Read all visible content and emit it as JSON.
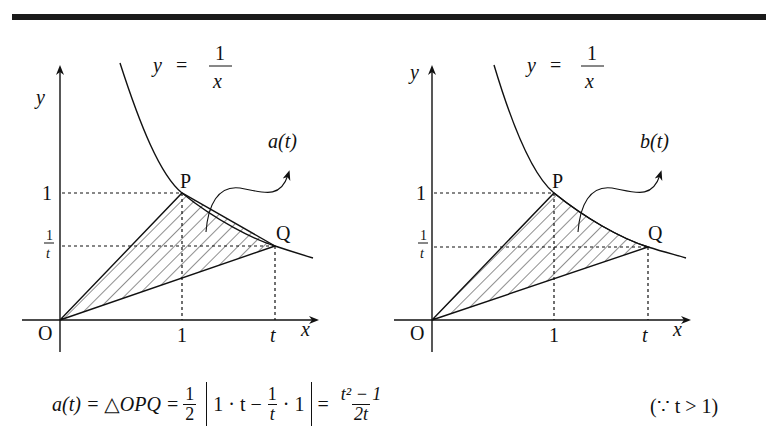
{
  "figures": [
    {
      "id": "left",
      "curve_label": {
        "lhs": "y",
        "eq": "=",
        "num": "1",
        "den": "x"
      },
      "axis_labels": {
        "y": "y",
        "x": "x",
        "origin": "O"
      },
      "tick_labels": {
        "x1": "1",
        "xt": "t",
        "y1": "1",
        "yt_num": "1",
        "yt_den": "t"
      },
      "points": {
        "P": "P",
        "Q": "Q"
      },
      "region_label": "a(t)",
      "region_desc": "Triangle OPQ (hatched)"
    },
    {
      "id": "right",
      "curve_label": {
        "lhs": "y",
        "eq": "=",
        "num": "1",
        "den": "x"
      },
      "axis_labels": {
        "y": "y",
        "x": "x",
        "origin": "O"
      },
      "tick_labels": {
        "x1": "1",
        "xt": "t",
        "y1": "1",
        "yt_num": "1",
        "yt_den": "t"
      },
      "points": {
        "P": "P",
        "Q": "Q"
      },
      "region_label": "b(t)",
      "region_desc": "Region bounded by OP, OQ and curve y=1/x (hatched)"
    }
  ],
  "formula": {
    "lhs": "a(t) = △OPQ =",
    "half_num": "1",
    "half_den": "2",
    "abs_left": "1 · t −",
    "inner_num": "1",
    "inner_den": "t",
    "abs_right": "· 1",
    "eq": "=",
    "result_num": "t² − 1",
    "result_den": "2t",
    "condition": "(∵ t > 1)"
  }
}
